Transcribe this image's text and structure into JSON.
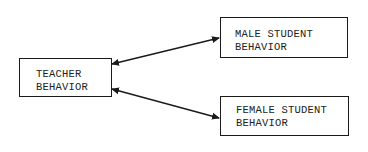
{
  "diagram": {
    "nodes": [
      {
        "id": "teacher",
        "lines": [
          "TEACHER",
          "BEHAVIOR"
        ]
      },
      {
        "id": "male",
        "lines": [
          "MALE STUDENT",
          "BEHAVIOR"
        ]
      },
      {
        "id": "female",
        "lines": [
          "FEMALE STUDENT",
          "BEHAVIOR"
        ]
      }
    ],
    "edges": [
      {
        "from": "teacher",
        "to": "male",
        "direction": "bidirectional"
      },
      {
        "from": "teacher",
        "to": "female",
        "direction": "bidirectional"
      }
    ],
    "colors": {
      "stroke": "#1a1a1a",
      "text": "#222222",
      "background": "#ffffff"
    }
  }
}
